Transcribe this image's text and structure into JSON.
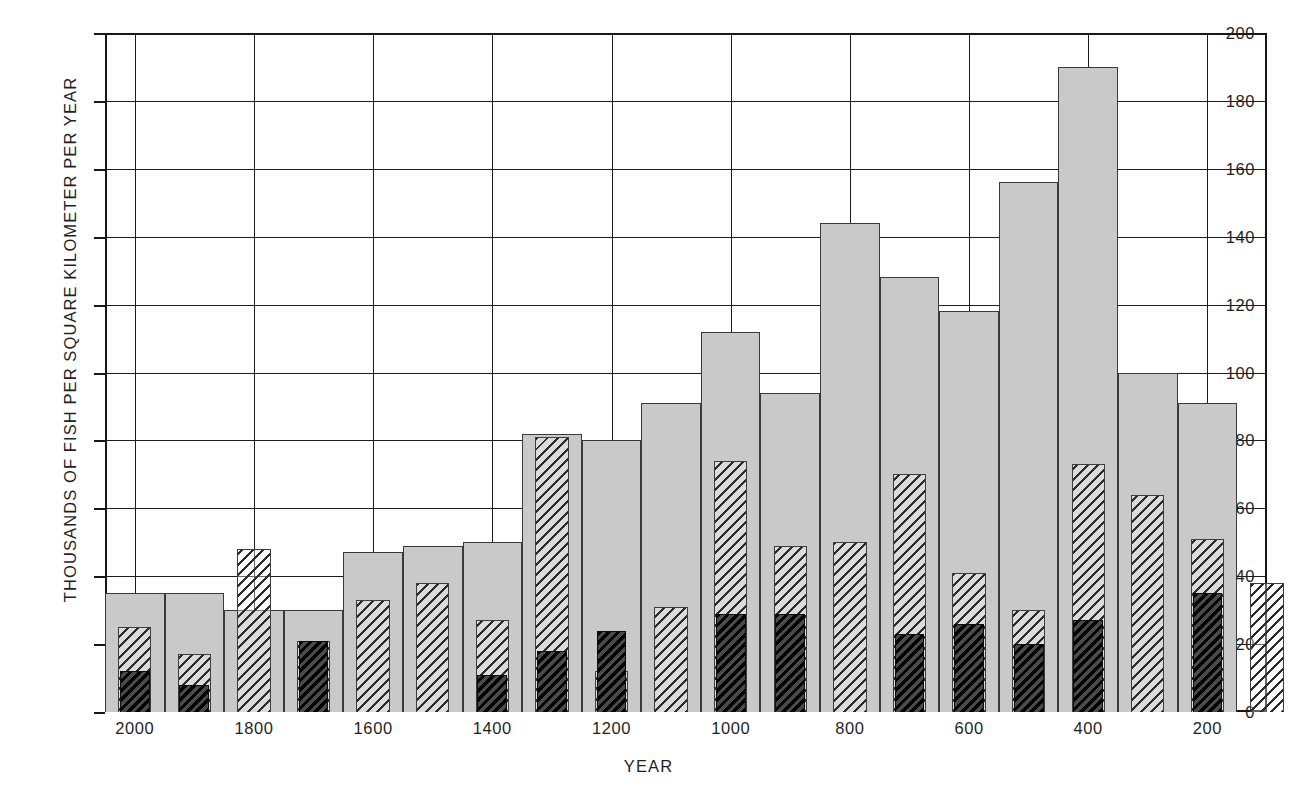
{
  "chart_data": {
    "type": "bar",
    "title": "",
    "xlabel": "YEAR",
    "ylabel": "THOUSANDS OF FISH PER SQUARE KILOMETER PER YEAR",
    "ylim": [
      0,
      200
    ],
    "yticks": [
      0,
      20,
      40,
      60,
      80,
      100,
      120,
      140,
      160,
      180,
      200
    ],
    "xticks": [
      2000,
      1800,
      1600,
      1400,
      1200,
      1000,
      800,
      600,
      400,
      200
    ],
    "xlim": [
      2050,
      100
    ],
    "x_axis_direction": "descending",
    "grid": true,
    "legend": "none",
    "bin_width_years": 100,
    "categories": [
      2000,
      1900,
      1800,
      1700,
      1600,
      1500,
      1400,
      1300,
      1200,
      1100,
      1000,
      900,
      800,
      700,
      600,
      500,
      400,
      300,
      200,
      100
    ],
    "series": [
      {
        "name": "background-gray",
        "style": "solid-light-gray",
        "values": [
          35,
          35,
          30,
          30,
          47,
          49,
          50,
          82,
          80,
          91,
          112,
          94,
          144,
          128,
          118,
          156,
          190,
          100,
          91,
          0
        ]
      },
      {
        "name": "mid-hatched",
        "style": "light-diagonal-hatch",
        "values": [
          25,
          17,
          48,
          21,
          33,
          38,
          27,
          81,
          12,
          31,
          74,
          49,
          50,
          70,
          41,
          30,
          73,
          64,
          51,
          38
        ]
      },
      {
        "name": "front-dark",
        "style": "dark-dense-hatch",
        "values": [
          12,
          8,
          0,
          21,
          0,
          0,
          11,
          18,
          24,
          0,
          29,
          29,
          0,
          23,
          26,
          20,
          27,
          0,
          35,
          0
        ]
      }
    ]
  }
}
